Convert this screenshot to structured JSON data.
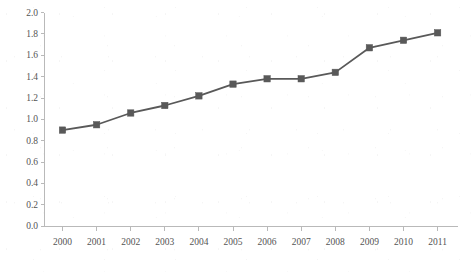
{
  "chart_data": {
    "type": "line",
    "title": "",
    "subtitle": "",
    "xlabel": "",
    "ylabel": "",
    "categories": [
      "2000",
      "2001",
      "2002",
      "2003",
      "2004",
      "2005",
      "2006",
      "2007",
      "2008",
      "2009",
      "2010",
      "2011"
    ],
    "values": [
      0.9,
      0.95,
      1.06,
      1.13,
      1.22,
      1.33,
      1.38,
      1.38,
      1.44,
      1.67,
      1.74,
      1.81
    ],
    "series": [
      {
        "name": "series-1",
        "values": [
          0.9,
          0.95,
          1.06,
          1.13,
          1.22,
          1.33,
          1.38,
          1.38,
          1.44,
          1.67,
          1.74,
          1.81
        ],
        "color": "#595959",
        "marker": "square"
      }
    ],
    "ylim": [
      0.0,
      2.0
    ],
    "ytick_step": 0.2,
    "ytick_labels": [
      "0.0",
      "0.2",
      "0.4",
      "0.6",
      "0.8",
      "1.0",
      "1.2",
      "1.4",
      "1.6",
      "1.8",
      "2.0"
    ],
    "xtick_labels": [
      "2000",
      "2001",
      "2002",
      "2003",
      "2004",
      "2005",
      "2006",
      "2007",
      "2008",
      "2009",
      "2010",
      "2011"
    ],
    "grid": false,
    "legend": false,
    "legend_position": "none",
    "axis_color": "#b9b9b9",
    "tick_label_color": "#545454"
  },
  "caption": {
    "text": ""
  }
}
